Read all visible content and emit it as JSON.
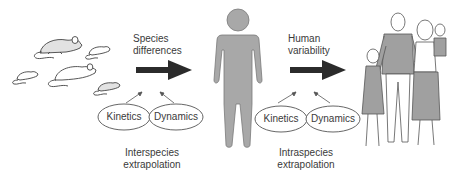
{
  "diagram": {
    "stages": [
      {
        "id": "rodents",
        "depicts": "laboratory rodents (rats and mice)"
      },
      {
        "id": "human",
        "depicts": "single average human figure"
      },
      {
        "id": "population",
        "depicts": "human family / population"
      }
    ],
    "transitions": [
      {
        "id": "interspecies",
        "arrow_label_line1": "Species",
        "arrow_label_line2": "differences",
        "factors": [
          "Kinetics",
          "Dynamics"
        ],
        "caption_line1": "Interspecies",
        "caption_line2": "extrapolation"
      },
      {
        "id": "intraspecies",
        "arrow_label_line1": "Human",
        "arrow_label_line2": "variability",
        "factors": [
          "Kinetics",
          "Dynamics"
        ],
        "caption_line1": "Intraspecies",
        "caption_line2": "extrapolation"
      }
    ],
    "colors": {
      "arrow": "#2b2b2b",
      "human_fill": "#a8a8a8",
      "human_stroke": "#7a7a7a",
      "rodent_fill": "#e0e0e0",
      "line": "#555555",
      "clothing_fill": "#9e9e9e"
    }
  }
}
